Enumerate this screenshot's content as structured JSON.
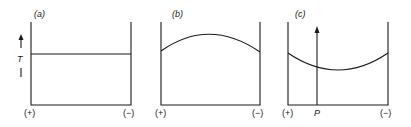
{
  "panels": [
    {
      "id": "a",
      "label": "(a)",
      "left_label": "(+)",
      "right_label": "(−)",
      "profile": "flat",
      "axis_label": "T"
    },
    {
      "id": "b",
      "label": "(b)",
      "left_label": "(+)",
      "right_label": "(−)",
      "profile": "convex (maximum in middle)"
    },
    {
      "id": "c",
      "label": "(c)",
      "left_label": "(+)",
      "right_label": "(−)",
      "profile": "concave (minimum in middle)",
      "marker_label": "P"
    }
  ],
  "colors": {
    "ink": "#1a1a1a",
    "background": "#ffffff"
  }
}
